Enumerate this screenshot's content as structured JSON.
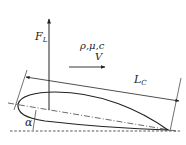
{
  "diagram": {
    "type": "airfoil-schematic",
    "labels": {
      "lift_force": "F",
      "lift_force_sub": "L",
      "flow_properties": "ρ,μ,c",
      "velocity": "V",
      "chord_length": "L",
      "chord_length_sub": "C",
      "angle_of_attack": "α"
    },
    "colors": {
      "stroke": "#222222",
      "background": "#ffffff"
    },
    "elements": [
      {
        "name": "lift-arrow",
        "kind": "arrow",
        "direction": "up"
      },
      {
        "name": "velocity-arrow",
        "kind": "arrow",
        "direction": "right"
      },
      {
        "name": "chord-length-dimension",
        "kind": "double-arrow"
      },
      {
        "name": "airfoil-profile",
        "kind": "shape"
      },
      {
        "name": "chord-line",
        "kind": "dash-dot-line"
      },
      {
        "name": "horizontal-reference",
        "kind": "dashed-line"
      },
      {
        "name": "angle-of-attack-marker",
        "kind": "angle"
      }
    ]
  }
}
